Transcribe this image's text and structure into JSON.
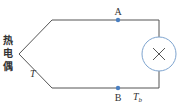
{
  "diagram": {
    "title_vertical": [
      "热",
      "电",
      "偶"
    ],
    "labels": {
      "point_a": "A",
      "point_b": "B",
      "junction_temp": "T",
      "reference_temp_main": "T",
      "reference_temp_sub": "b"
    },
    "components": {
      "meter": "×"
    },
    "colors": {
      "wire": "#555555",
      "dot": "#4a7fc1",
      "meter_circle": "#7ea4cf",
      "text": "#333333"
    }
  }
}
